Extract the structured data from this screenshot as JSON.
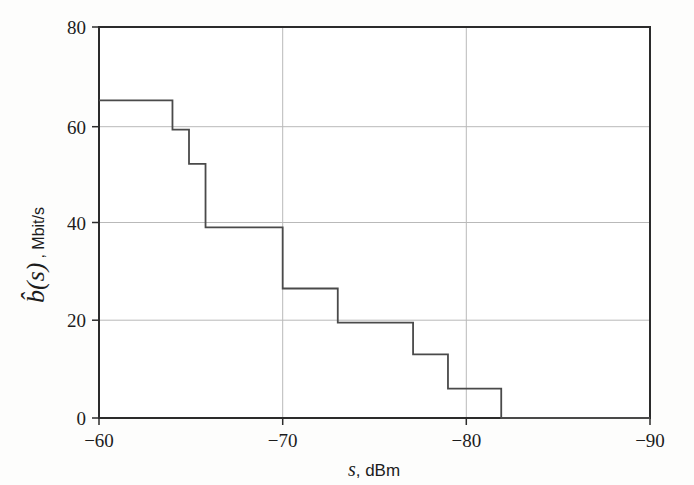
{
  "figure": {
    "background_color": "#fdfdfc",
    "frame_color": "#2b2b2b",
    "grid_color": "#b9b9b9",
    "line_color": "#4a4a4a"
  },
  "axes": {
    "x": {
      "label_var": "s",
      "label_unit": ", dBm",
      "label_full": "s, dBm",
      "ticks": [
        "−60",
        "−70",
        "−80",
        "−90"
      ],
      "tick_values": [
        -60,
        -70,
        -80,
        -90
      ],
      "range": [
        -60,
        -90
      ]
    },
    "y": {
      "label_var": "b̂(s)",
      "label_unit": ", Mbit/s",
      "label_full": "b̂(s) , Mbit/s",
      "ticks": [
        "0",
        "20",
        "40",
        "60",
        "80"
      ],
      "tick_values": [
        0,
        20,
        40,
        60,
        80
      ],
      "range": [
        0,
        80
      ]
    }
  },
  "chart_data": {
    "type": "line",
    "subtype": "step",
    "title": "",
    "xlabel": "s, dBm",
    "ylabel": "b̂(s) , Mbit/s",
    "xlim": [
      -60,
      -90
    ],
    "ylim": [
      0,
      80
    ],
    "grid": true,
    "grid_x_values": [
      -70,
      -80
    ],
    "grid_y_values": [
      20,
      40,
      60
    ],
    "legend": null,
    "x": [
      -60,
      -64.0,
      -64.9,
      -65.8,
      -70.0,
      -73.0,
      -77.1,
      -79.0,
      -81.9
    ],
    "y": [
      65,
      59,
      52,
      39,
      26.5,
      19.5,
      13,
      6,
      0
    ],
    "series": [
      {
        "name": "b̂(s)",
        "steps": [
          {
            "x_start": -60.0,
            "x_end": -64.0,
            "value": 65
          },
          {
            "x_start": -64.0,
            "x_end": -64.9,
            "value": 59
          },
          {
            "x_start": -64.9,
            "x_end": -65.8,
            "value": 52
          },
          {
            "x_start": -65.8,
            "x_end": -70.0,
            "value": 39
          },
          {
            "x_start": -70.0,
            "x_end": -73.0,
            "value": 26.5
          },
          {
            "x_start": -73.0,
            "x_end": -77.1,
            "value": 19.5
          },
          {
            "x_start": -77.1,
            "x_end": -79.0,
            "value": 13
          },
          {
            "x_start": -79.0,
            "x_end": -81.9,
            "value": 6
          },
          {
            "x_start": -81.9,
            "x_end": -90.0,
            "value": 0
          }
        ]
      }
    ]
  }
}
